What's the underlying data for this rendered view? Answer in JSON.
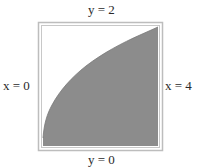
{
  "diagram": {
    "boundaries": {
      "top": "y = 2",
      "bottom": "y = 0",
      "left": "x = 0",
      "right": "x = 4"
    },
    "curve": "y = sqrt(x)",
    "x_range": [
      0,
      4
    ],
    "y_range": [
      0,
      2
    ],
    "colors": {
      "region_fill": "#8a8a8a",
      "frame": "#b5b5b5",
      "background": "#ffffff"
    }
  }
}
